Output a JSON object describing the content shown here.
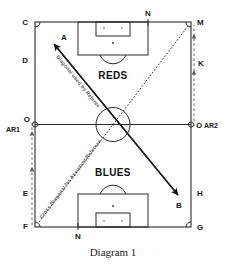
{
  "figure": {
    "caption": "Diagram 1",
    "title": "Diagram 1"
  },
  "teams": {
    "top": "REDS",
    "bottom": "BLUES"
  },
  "annotations": {
    "referee_diagonal": "Diagonal used by Referee",
    "assistant_diagonal": "Cross Diagonal for Assistant Referees"
  },
  "arrow_points": {
    "a": "A",
    "b": "B"
  },
  "position_labels": {
    "top_left_corner": "C",
    "left_upper": "D",
    "top_goal_line": "N",
    "top_right_corner": "M",
    "right_upper": "K",
    "left_halfway": "O",
    "right_halfway": "O",
    "assistant_referee_1": "AR1",
    "assistant_referee_2": "AR2",
    "left_lower": "E",
    "bottom_left_corner": "F",
    "bottom_goal_line": "N",
    "right_lower": "H",
    "bottom_right_corner": "G"
  },
  "colors": {
    "line": "#2b2b2b",
    "diagonal": "#1a1a1a",
    "assistant_path": "#6e6e6e",
    "annotation_text": "#5a5a5a",
    "background": "#ffffff"
  }
}
